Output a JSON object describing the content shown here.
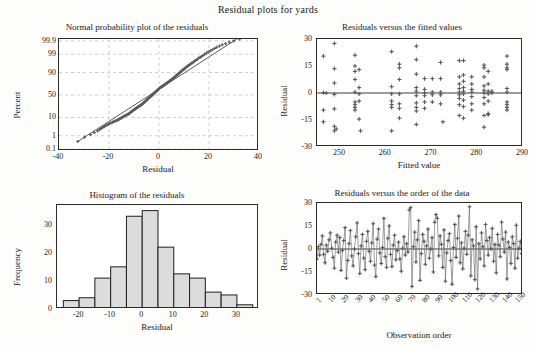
{
  "figure": {
    "title": "Residual plots for yards",
    "colors": {
      "marker": "#5a5a5a",
      "bar_fill": "#dcdcdc",
      "bar_edge": "#1f1f1f",
      "axis": "#2a2a2a",
      "grid": "#b9b9b9",
      "background": "#ffffff"
    }
  },
  "chart_data": [
    {
      "id": "normal-probability-plot",
      "type": "scatter",
      "title": "Normal probability plot of the residuals",
      "xlabel": "Residual",
      "ylabel": "Percent",
      "xlim": [
        -40,
        40
      ],
      "xticks": [
        -40,
        -20,
        0,
        20,
        40
      ],
      "xticklabels": [
        "-40",
        "-20",
        "0",
        "20",
        "40"
      ],
      "yticks": [
        0.1,
        1,
        10,
        50,
        90,
        99,
        99.9
      ],
      "yticklabels": [
        "0.1",
        "1",
        "10",
        "50",
        "90",
        "99",
        "99.9"
      ],
      "yscale": "normal-probability",
      "grid": true,
      "fit_line": true,
      "x": [
        -32.5,
        -29.8,
        -27.4,
        -25.9,
        -24.6,
        -23.8,
        -23.1,
        -22.5,
        -21.9,
        -21.3,
        -20.8,
        -20.2,
        -19.7,
        -19.2,
        -18.6,
        -18.1,
        -17.6,
        -17.1,
        -16.7,
        -16.2,
        -15.8,
        -15.3,
        -14.9,
        -14.5,
        -14.1,
        -13.7,
        -13.3,
        -12.9,
        -12.5,
        -12.1,
        -11.8,
        -11.4,
        -11.0,
        -10.7,
        -10.3,
        -10.0,
        -9.6,
        -9.3,
        -9.0,
        -8.6,
        -8.3,
        -8.0,
        -7.7,
        -7.3,
        -7.0,
        -6.7,
        -6.4,
        -6.1,
        -5.8,
        -5.5,
        -5.2,
        -4.9,
        -4.6,
        -4.3,
        -4.0,
        -3.7,
        -3.4,
        -3.1,
        -2.8,
        -2.5,
        -2.3,
        -2.0,
        -1.7,
        -1.4,
        -1.1,
        -0.8,
        -0.5,
        -0.2,
        0.1,
        0.4,
        0.7,
        1.0,
        1.3,
        1.6,
        1.9,
        2.2,
        2.5,
        2.8,
        3.1,
        3.4,
        3.7,
        4.1,
        4.4,
        4.7,
        5.0,
        5.4,
        5.7,
        6.0,
        6.4,
        6.7,
        7.1,
        7.4,
        7.8,
        8.2,
        8.5,
        8.9,
        9.3,
        9.7,
        10.1,
        10.5,
        10.9,
        11.4,
        11.8,
        12.3,
        12.7,
        13.2,
        13.7,
        14.2,
        14.7,
        15.3,
        15.8,
        16.4,
        17.0,
        17.6,
        18.3,
        19.0,
        19.7,
        20.5,
        21.3,
        22.2,
        23.1,
        24.2,
        25.3,
        26.6,
        28.1,
        29.9,
        32.2
      ],
      "percent": [
        0.4,
        0.8,
        1.2,
        1.6,
        2.0,
        2.4,
        2.8,
        3.2,
        3.6,
        4.0,
        4.4,
        4.8,
        5.2,
        5.6,
        6.0,
        6.4,
        6.8,
        7.2,
        7.6,
        8.0,
        8.6,
        9.2,
        9.8,
        10.4,
        11.0,
        11.6,
        12.2,
        12.8,
        13.4,
        14.0,
        15.0,
        16.0,
        17.0,
        18.0,
        19.0,
        20.0,
        21.0,
        22.0,
        23.0,
        24.0,
        25.0,
        26.0,
        27.0,
        28.0,
        29.0,
        30.0,
        31.5,
        33.0,
        34.5,
        36.0,
        37.5,
        39.0,
        40.5,
        42.0,
        43.5,
        45.0,
        46.5,
        48.0,
        49.5,
        51.0,
        52.5,
        54.0,
        55.5,
        57.0,
        58.5,
        60.0,
        61.5,
        63.0,
        64.5,
        66.0,
        67.0,
        68.0,
        69.0,
        70.0,
        71.0,
        72.0,
        73.0,
        74.0,
        75.0,
        76.0,
        77.0,
        78.0,
        79.0,
        80.0,
        81.0,
        82.0,
        83.0,
        84.0,
        85.0,
        86.0,
        87.0,
        88.0,
        88.8,
        89.6,
        90.4,
        91.2,
        92.0,
        92.6,
        93.2,
        93.8,
        94.4,
        95.0,
        95.4,
        95.8,
        96.2,
        96.6,
        97.0,
        97.3,
        97.6,
        97.9,
        98.2,
        98.4,
        98.6,
        98.8,
        99.0,
        99.15,
        99.3,
        99.4,
        99.5,
        99.6,
        99.68,
        99.74,
        99.79,
        99.83,
        99.87,
        99.9,
        99.93,
        99.95
      ]
    },
    {
      "id": "residuals-vs-fitted",
      "type": "scatter",
      "title": "Residuals versus the fitted values",
      "xlabel": "Fitted value",
      "ylabel": "Residual",
      "xlim": [
        245,
        290
      ],
      "ylim": [
        -30,
        30
      ],
      "xticks": [
        250,
        260,
        270,
        280,
        290
      ],
      "xticklabels": [
        "250",
        "260",
        "270",
        "280",
        "290"
      ],
      "yticks": [
        -30,
        -15,
        0,
        15,
        30
      ],
      "yticklabels": [
        "-30",
        "-15",
        "0",
        "15",
        "30"
      ],
      "grid": false,
      "zero_line": true,
      "points": [
        [
          246.4,
          20.5
        ],
        [
          246.4,
          0.2
        ],
        [
          246.4,
          -9.5
        ],
        [
          246.4,
          -16.0
        ],
        [
          247.0,
          0.0
        ],
        [
          248.8,
          27.5
        ],
        [
          248.8,
          13.5
        ],
        [
          248.8,
          5.5
        ],
        [
          248.8,
          -0.8
        ],
        [
          248.8,
          -8.8
        ],
        [
          248.8,
          -18.5
        ],
        [
          248.8,
          -21.0
        ],
        [
          249.2,
          -20.0
        ],
        [
          253.3,
          21.0
        ],
        [
          253.3,
          15.0
        ],
        [
          253.3,
          12.0
        ],
        [
          253.3,
          7.5
        ],
        [
          253.3,
          0.5
        ],
        [
          253.3,
          -5.0
        ],
        [
          253.3,
          -6.5
        ],
        [
          253.3,
          -8.0
        ],
        [
          253.3,
          -9.5
        ],
        [
          254.2,
          13.0
        ],
        [
          254.2,
          3.0
        ],
        [
          254.2,
          -0.5
        ],
        [
          254.2,
          -4.5
        ],
        [
          254.2,
          -14.5
        ],
        [
          254.5,
          -21.0
        ],
        [
          261.3,
          23.0
        ],
        [
          261.3,
          3.5
        ],
        [
          261.3,
          -0.5
        ],
        [
          261.3,
          -4.5
        ],
        [
          261.3,
          -6.5
        ],
        [
          261.3,
          -8.0
        ],
        [
          261.3,
          -21.0
        ],
        [
          263.0,
          16.0
        ],
        [
          263.0,
          14.0
        ],
        [
          263.0,
          7.5
        ],
        [
          263.0,
          -0.5
        ],
        [
          263.0,
          -6.0
        ],
        [
          263.0,
          -8.5
        ],
        [
          263.0,
          -14.0
        ],
        [
          266.7,
          26.0
        ],
        [
          266.7,
          18.5
        ],
        [
          266.7,
          10.5
        ],
        [
          266.7,
          3.0
        ],
        [
          266.7,
          1.0
        ],
        [
          266.7,
          -1.5
        ],
        [
          266.7,
          -5.5
        ],
        [
          266.7,
          -8.0
        ],
        [
          266.7,
          -10.0
        ],
        [
          266.7,
          -17.5
        ],
        [
          268.5,
          8.0
        ],
        [
          268.5,
          2.0
        ],
        [
          268.5,
          0.0
        ],
        [
          268.5,
          -1.5
        ],
        [
          268.5,
          -5.0
        ],
        [
          268.5,
          -8.5
        ],
        [
          270.2,
          8.0
        ],
        [
          270.2,
          0.5
        ],
        [
          270.2,
          -1.0
        ],
        [
          270.2,
          -5.0
        ],
        [
          272.0,
          17.0
        ],
        [
          272.0,
          8.0
        ],
        [
          272.0,
          0.5
        ],
        [
          272.0,
          -1.0
        ],
        [
          272.0,
          -6.0
        ],
        [
          272.5,
          -16.0
        ],
        [
          276.1,
          18.0
        ],
        [
          276.1,
          9.0
        ],
        [
          276.1,
          5.0
        ],
        [
          276.1,
          2.5
        ],
        [
          276.1,
          0.5
        ],
        [
          276.1,
          -1.0
        ],
        [
          276.1,
          -3.0
        ],
        [
          276.1,
          -6.5
        ],
        [
          276.1,
          -12.5
        ],
        [
          277.0,
          18.0
        ],
        [
          277.0,
          10.0
        ],
        [
          277.0,
          6.5
        ],
        [
          277.0,
          3.0
        ],
        [
          277.0,
          1.0
        ],
        [
          277.0,
          -0.5
        ],
        [
          277.0,
          -4.0
        ],
        [
          277.0,
          -7.5
        ],
        [
          277.0,
          -14.0
        ],
        [
          278.8,
          9.0
        ],
        [
          278.8,
          5.0
        ],
        [
          278.8,
          2.0
        ],
        [
          278.8,
          0.5
        ],
        [
          278.8,
          -2.0
        ],
        [
          278.8,
          -6.0
        ],
        [
          278.8,
          -9.5
        ],
        [
          281.5,
          15.5
        ],
        [
          281.5,
          14.0
        ],
        [
          281.5,
          9.0
        ],
        [
          281.5,
          4.0
        ],
        [
          281.5,
          1.5
        ],
        [
          281.5,
          0.0
        ],
        [
          281.5,
          -2.5
        ],
        [
          281.5,
          -6.0
        ],
        [
          281.5,
          -12.5
        ],
        [
          281.5,
          -19.0
        ],
        [
          282.4,
          12.0
        ],
        [
          282.4,
          5.0
        ],
        [
          282.4,
          1.0
        ],
        [
          282.4,
          -0.5
        ],
        [
          282.4,
          -4.5
        ],
        [
          282.4,
          -11.5
        ],
        [
          282.4,
          -12.0
        ],
        [
          283.2,
          1.0
        ],
        [
          283.2,
          0.0
        ],
        [
          286.5,
          20.5
        ],
        [
          286.5,
          16.0
        ],
        [
          286.5,
          14.0
        ],
        [
          286.5,
          13.0
        ],
        [
          286.5,
          2.5
        ],
        [
          286.5,
          0.5
        ],
        [
          286.5,
          -5.0
        ],
        [
          286.5,
          -6.5
        ],
        [
          286.5,
          -8.0
        ],
        [
          286.5,
          -9.5
        ]
      ]
    },
    {
      "id": "histogram-of-residuals",
      "type": "bar",
      "title": "Histogram of the residuals",
      "xlabel": "Residual",
      "ylabel": "Frequency",
      "xlim": [
        -27,
        37
      ],
      "ylim": [
        0,
        37
      ],
      "xticks": [
        -20,
        -10,
        0,
        10,
        20,
        30
      ],
      "xticklabels": [
        "-20",
        "-10",
        "0",
        "10",
        "20",
        "30"
      ],
      "yticks": [
        0,
        10,
        20,
        30
      ],
      "yticklabels": [
        "0",
        "10",
        "20",
        "30"
      ],
      "bin_width": 5,
      "bin_starts": [
        -25,
        -20,
        -15,
        -10,
        -5,
        0,
        5,
        10,
        15,
        20,
        25,
        30
      ],
      "values": [
        3,
        4,
        11,
        15,
        33,
        35,
        22,
        12.5,
        11,
        6,
        5,
        1.5
      ],
      "grid": false
    },
    {
      "id": "residuals-vs-order",
      "type": "line",
      "title": "Residuals versus the order of the data",
      "xlabel": "Observation order",
      "ylabel": "Residual",
      "xlim": [
        1,
        155
      ],
      "ylim": [
        -30,
        30
      ],
      "xticks": [
        1,
        10,
        20,
        30,
        40,
        50,
        60,
        70,
        80,
        90,
        100,
        110,
        120,
        130,
        140,
        150
      ],
      "xticklabels": [
        "1",
        "10",
        "20",
        "30",
        "40",
        "50",
        "60",
        "70",
        "80",
        "90",
        "100",
        "110",
        "120",
        "130",
        "140",
        "150"
      ],
      "yticks": [
        -30,
        -15,
        0,
        15,
        30
      ],
      "yticklabels": [
        "-30",
        "-15",
        "0",
        "15",
        "30"
      ],
      "zero_line": true,
      "grid": false,
      "values": [
        -6.5,
        1.5,
        -4.0,
        3.0,
        8.5,
        -3.5,
        -9.0,
        2.5,
        -1.5,
        6.0,
        10.5,
        0.5,
        -5.5,
        -12.5,
        4.5,
        9.0,
        -2.0,
        7.5,
        -14.0,
        -1.0,
        5.5,
        14.0,
        -19.0,
        -7.5,
        3.5,
        12.0,
        -4.5,
        -11.0,
        0.0,
        8.0,
        17.0,
        -3.0,
        -16.0,
        2.0,
        9.5,
        -6.0,
        -13.5,
        5.0,
        11.5,
        -1.5,
        -8.0,
        4.0,
        16.5,
        -10.5,
        -18.0,
        6.5,
        13.0,
        -2.5,
        -9.5,
        1.0,
        20.0,
        -5.0,
        -12.0,
        7.0,
        15.0,
        -3.5,
        -11.5,
        2.5,
        9.0,
        -7.0,
        -1.0,
        4.5,
        -6.5,
        -14.5,
        0.5,
        8.0,
        -4.0,
        3.5,
        -2.0,
        25.5,
        27.0,
        -24.5,
        1.5,
        11.0,
        -8.5,
        6.0,
        18.5,
        -20.5,
        -3.0,
        9.5,
        5.0,
        -10.0,
        2.0,
        13.0,
        -6.0,
        0.0,
        7.5,
        -15.0,
        17.5,
        22.5,
        20.0,
        -4.5,
        8.5,
        3.0,
        -12.0,
        12.5,
        -21.0,
        -2.5,
        5.5,
        10.0,
        -7.5,
        -23.0,
        1.0,
        16.0,
        -5.5,
        7.0,
        21.5,
        -9.0,
        4.0,
        -13.0,
        0.5,
        11.5,
        -3.5,
        9.0,
        27.5,
        -17.5,
        6.0,
        2.0,
        -20.0,
        14.5,
        -26.0,
        3.5,
        -6.5,
        10.5,
        1.5,
        -11.0,
        16.0,
        5.5,
        -4.0,
        7.5,
        0.0,
        13.5,
        -8.0,
        3.0,
        -15.5,
        9.5,
        2.5,
        -5.0,
        17.5,
        6.5,
        -2.0,
        11.0,
        -19.5,
        4.5,
        1.0,
        -9.5,
        8.0,
        3.5,
        -12.5,
        15.5,
        -6.0,
        0.5,
        5.0,
        -3.0,
        2.0
      ]
    }
  ]
}
